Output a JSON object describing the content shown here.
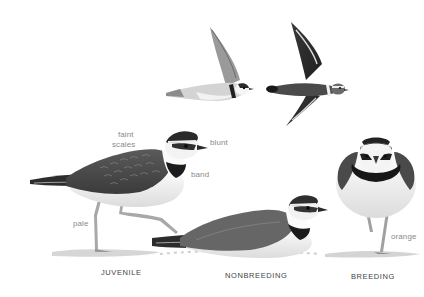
{
  "plate": {
    "subject": "plover field-guide plate",
    "colors": {
      "background": "#ffffff",
      "dark_plumage": "#2a2a2a",
      "mid_plumage": "#6e6e6e",
      "light_plumage": "#f4f4f4",
      "label_text": "#8a8a8a",
      "caption_text": "#444444"
    }
  },
  "annotations": {
    "faint_scales": "faint\nscales",
    "faint": "faint",
    "scales": "scales",
    "blunt": "blunt",
    "band": "band",
    "pale": "pale",
    "orange": "orange"
  },
  "captions": {
    "juvenile": "JUVENILE",
    "nonbreeding": "NONBREEDING",
    "breeding": "BREEDING"
  },
  "figures": [
    {
      "id": "flight-underside",
      "pose": "flying, underside view"
    },
    {
      "id": "flight-upperside",
      "pose": "flying, upperside view"
    },
    {
      "id": "juvenile",
      "pose": "walking, side view"
    },
    {
      "id": "nonbreeding",
      "pose": "resting, side view"
    },
    {
      "id": "breeding",
      "pose": "standing, front view"
    }
  ]
}
